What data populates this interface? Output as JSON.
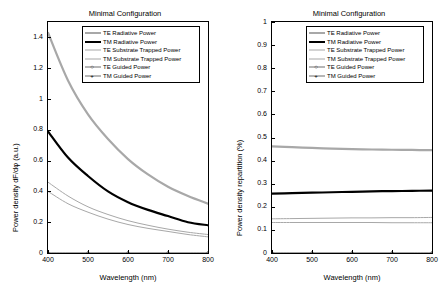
{
  "figure": {
    "background": "#ffffff",
    "panels": [
      {
        "key": "left",
        "title": "Minimal Configuration",
        "xlabel": "Wavelength (nm)",
        "ylabel": "Power density dF/dφ (a.u.)"
      },
      {
        "key": "right",
        "title": "Minimal Configuration",
        "xlabel": "Wavelength (nm)",
        "ylabel": "Power density repartition (%)"
      }
    ]
  },
  "legend": {
    "entries": [
      {
        "label": "TE Radiative Power",
        "color": "#a8a8a8",
        "width": 2.2,
        "marker": "none"
      },
      {
        "label": "TM Radiative Power",
        "color": "#000000",
        "width": 2.2,
        "marker": "none"
      },
      {
        "label": "TE Substrate Trapped Power",
        "color": "#a8a8a8",
        "width": 1.0,
        "marker": "none"
      },
      {
        "label": "TM Substrate Trapped Power",
        "color": "#a8a8a8",
        "width": 1.0,
        "marker": "none"
      },
      {
        "label": "TE Guided Power",
        "color": "#6f6f6f",
        "width": 0.8,
        "marker": "circle"
      },
      {
        "label": "TM Guided Power",
        "color": "#6f6f6f",
        "width": 0.8,
        "marker": "plus"
      }
    ]
  },
  "chart_data": [
    {
      "type": "line",
      "panel": "left",
      "title": "Minimal Configuration",
      "xlabel": "Wavelength (nm)",
      "ylabel": "Power density dF/dφ (a.u.)",
      "xlim": [
        400,
        800
      ],
      "ylim": [
        0,
        1.5
      ],
      "xticks": [
        400,
        500,
        600,
        700,
        800
      ],
      "yticks": [
        0,
        0.2,
        0.4,
        0.6,
        0.8,
        1,
        1.2,
        1.4
      ],
      "ytick_labels": [
        "0",
        "0.2",
        "0.4",
        "0.6",
        "0.8",
        "1",
        "1.2",
        "1.4"
      ],
      "grid": false,
      "legend_position": "top-right",
      "x": [
        400,
        450,
        500,
        550,
        600,
        650,
        700,
        750,
        800
      ],
      "series": [
        {
          "name": "TE Radiative Power",
          "color": "#a8a8a8",
          "values": [
            1.43,
            1.12,
            0.9,
            0.74,
            0.61,
            0.51,
            0.43,
            0.37,
            0.32
          ]
        },
        {
          "name": "TM Radiative Power",
          "color": "#000000",
          "values": [
            0.79,
            0.62,
            0.5,
            0.4,
            0.33,
            0.28,
            0.24,
            0.2,
            0.18
          ]
        },
        {
          "name": "TE Substrate Trapped Power",
          "color": "#a8a8a8",
          "values": [
            0.46,
            0.37,
            0.3,
            0.25,
            0.21,
            0.18,
            0.155,
            0.135,
            0.12
          ]
        },
        {
          "name": "TM Substrate Trapped Power",
          "color": "#a8a8a8",
          "values": [
            0.4,
            0.32,
            0.265,
            0.22,
            0.185,
            0.16,
            0.14,
            0.12,
            0.105
          ]
        },
        {
          "name": "TE Guided Power",
          "color": "#6f6f6f",
          "values": [
            0.0,
            0.0,
            0.0,
            0.0,
            0.0,
            0.0,
            0.0,
            0.0,
            0.0
          ]
        },
        {
          "name": "TM Guided Power",
          "color": "#6f6f6f",
          "values": [
            0.0,
            0.0,
            0.0,
            0.0,
            0.0,
            0.0,
            0.0,
            0.0,
            0.0
          ]
        }
      ]
    },
    {
      "type": "line",
      "panel": "right",
      "title": "Minimal Configuration",
      "xlabel": "Wavelength (nm)",
      "ylabel": "Power density repartition (%)",
      "xlim": [
        400,
        800
      ],
      "ylim": [
        0,
        1
      ],
      "xticks": [
        400,
        500,
        600,
        700,
        800
      ],
      "yticks": [
        0,
        0.1,
        0.2,
        0.3,
        0.4,
        0.5,
        0.6,
        0.7,
        0.8,
        0.9,
        1
      ],
      "ytick_labels": [
        "0",
        "0.1",
        "0.2",
        "0.3",
        "0.4",
        "0.5",
        "0.6",
        "0.7",
        "0.8",
        "0.9",
        "1"
      ],
      "grid": false,
      "legend_position": "top-right",
      "x": [
        400,
        450,
        500,
        550,
        600,
        650,
        700,
        750,
        800
      ],
      "series": [
        {
          "name": "TE Radiative Power",
          "color": "#a8a8a8",
          "values": [
            0.462,
            0.458,
            0.455,
            0.452,
            0.45,
            0.448,
            0.447,
            0.446,
            0.445
          ]
        },
        {
          "name": "TM Radiative Power",
          "color": "#000000",
          "values": [
            0.257,
            0.259,
            0.261,
            0.263,
            0.265,
            0.267,
            0.268,
            0.269,
            0.27
          ]
        },
        {
          "name": "TE Substrate Trapped Power",
          "color": "#a8a8a8",
          "values": [
            0.148,
            0.149,
            0.15,
            0.151,
            0.152,
            0.152,
            0.153,
            0.153,
            0.154
          ]
        },
        {
          "name": "TM Substrate Trapped Power",
          "color": "#a8a8a8",
          "values": [
            0.132,
            0.132,
            0.132,
            0.132,
            0.132,
            0.132,
            0.131,
            0.131,
            0.131
          ]
        },
        {
          "name": "TE Guided Power",
          "color": "#6f6f6f",
          "values": [
            0.0,
            0.0,
            0.0,
            0.0,
            0.0,
            0.0,
            0.0,
            0.0,
            0.0
          ]
        },
        {
          "name": "TM Guided Power",
          "color": "#6f6f6f",
          "values": [
            0.0,
            0.0,
            0.0,
            0.0,
            0.0,
            0.0,
            0.0,
            0.0,
            0.0
          ]
        }
      ]
    }
  ]
}
